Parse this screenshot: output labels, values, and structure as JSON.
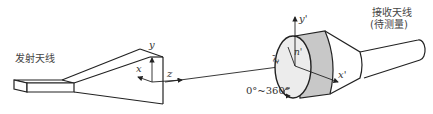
{
  "diagram": {
    "title": "",
    "transmit_antenna": {
      "label": "发射天线"
    },
    "receive_antenna": {
      "label_line1": "接收天线",
      "label_line2": "(待测量)"
    },
    "transmit_axes": {
      "x": "x",
      "y": "y",
      "z": "z"
    },
    "receive_axes": {
      "x": "x'",
      "y": "y'",
      "z": "z'"
    },
    "polarization_angle_label": "n'",
    "rotation_range": "0°~360°",
    "colors": {
      "line": "#222222",
      "band_fill": "#c8c8c8",
      "face_fill": "#ececec",
      "background": "#ffffff"
    }
  }
}
